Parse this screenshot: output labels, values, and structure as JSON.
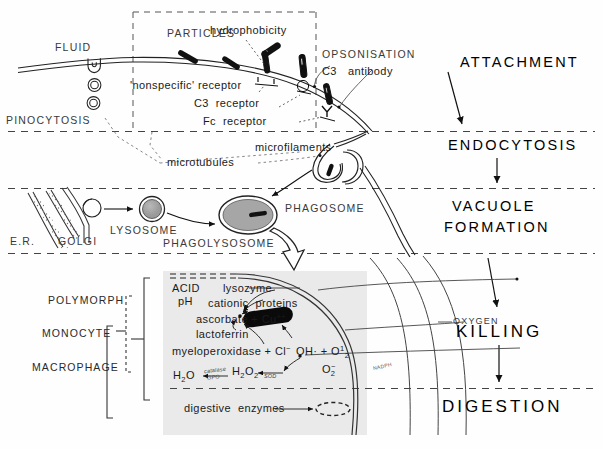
{
  "diagram": {
    "background": "#fefefe",
    "ink": "#111111"
  },
  "stages": [
    {
      "id": "attachment",
      "label": "ATTACHMENT"
    },
    {
      "id": "endocytosis",
      "label": "ENDOCYTOSIS"
    },
    {
      "id": "vacuole_formation_line1",
      "label": "VACUOLE"
    },
    {
      "id": "vacuole_formation_line2",
      "label": "FORMATION"
    },
    {
      "id": "killing",
      "label": "KILLING"
    },
    {
      "id": "digestion",
      "label": "DIGESTION"
    }
  ],
  "top_panel": {
    "fluid": "FLUID",
    "particles": "PARTICLES",
    "hydrophobicity": "hydrophobicity",
    "opsonisation": "OPSONISATION",
    "c3": "C3",
    "antibody": "antibody",
    "nonspecific_receptor": "'nonspecific' receptor",
    "c3_receptor": "C3  receptor",
    "fc_receptor": "Fc  receptor",
    "pinocytosis": "PINOCYTOSIS"
  },
  "mid_panel": {
    "microtubules": "microtubules",
    "microfilaments": "microfilaments",
    "er": "E.R.",
    "golgi": "GOLGI",
    "lysosome": "LYSOSOME",
    "phagolysosome": "PHAGOLYSOSOME",
    "phagosome": "PHAGOSOME"
  },
  "cell_types": [
    {
      "id": "polymorph",
      "label": "POLYMORPH"
    },
    {
      "id": "monocyte",
      "label": "MONOCYTE"
    },
    {
      "id": "macrophage",
      "label": "MACROPHAGE"
    }
  ],
  "killing_panel": {
    "acid": "ACID",
    "ph": "pH",
    "agents": [
      "lysozyme",
      "cationic  proteins",
      "ascorbate + Cu",
      "lactoferrin",
      "myeloperoxidase + Cl"
    ],
    "ascorbate_superscript": "++",
    "myeloperoxidase_superscript": "−",
    "oxygen": "OXYGEN",
    "nadph": "NADPH",
    "digestive_enzymes": "digestive  enzymes",
    "radicals": {
      "hydroxyl_singlet": "OH· + O",
      "hydroxyl_singlet_sup": "1",
      "hydroxyl_singlet_sub": "2",
      "superoxide": "O",
      "superoxide_sub": "2",
      "superoxide_sup": "−",
      "peroxide": "H",
      "peroxide_sub1": "2",
      "peroxide_mid": "O",
      "peroxide_sub2": "2",
      "water": "H",
      "water_sub": "2",
      "water_mid": "O"
    },
    "enzymes": {
      "catalase": "catalase",
      "gpo": "GPO",
      "sod": "SOD"
    }
  }
}
